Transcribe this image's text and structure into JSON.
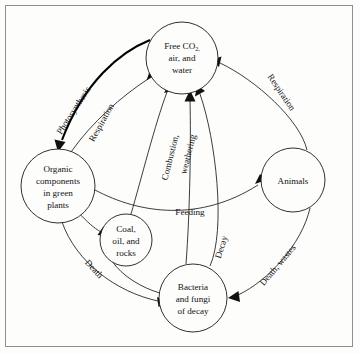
{
  "figure": {
    "background_color": "#fdfdfc",
    "frame_color": "#8f8f8f",
    "ink_color": "#111111"
  },
  "nodes": [
    {
      "id": "free-co2",
      "name": "free-co2-node",
      "lines": [
        "Free CO",
        "air, and",
        "water"
      ],
      "line1_main": "Free CO",
      "line1_sub": "2,",
      "line2": "air, and",
      "line3": "water",
      "cx": 182,
      "cy": 58,
      "r": 36
    },
    {
      "id": "organic-components",
      "name": "organic-components-node",
      "lines": [
        "Organic",
        "components",
        "in green",
        "plants"
      ],
      "cx": 58,
      "cy": 186,
      "r": 37
    },
    {
      "id": "coal-oil-rocks",
      "name": "coal-oil-rocks-node",
      "lines": [
        "Coal,",
        "oil, and",
        "rocks"
      ],
      "cx": 126,
      "cy": 240,
      "r": 26
    },
    {
      "id": "bacteria-fungi",
      "name": "bacteria-fungi-node",
      "lines": [
        "Bacteria",
        "and fungi",
        "of decay"
      ],
      "cx": 193,
      "cy": 298,
      "r": 34
    },
    {
      "id": "animals",
      "name": "animals-node",
      "lines": [
        "Animals"
      ],
      "cx": 293,
      "cy": 180,
      "r": 32
    }
  ],
  "edges": [
    {
      "id": "photosynthesis",
      "name": "photosynthesis-arrow",
      "label": "Photosynthesis",
      "from": "free-co2",
      "to": "organic-components",
      "style": "bold",
      "label_x": 76,
      "label_y": 112,
      "label_rotate": -57
    },
    {
      "id": "respiration-plants",
      "name": "respiration-plants-arrow",
      "label": "Respiration",
      "from": "organic-components",
      "to": "free-co2",
      "style": "thin",
      "label_x": 104,
      "label_y": 124,
      "label_rotate": -61
    },
    {
      "id": "combustion",
      "name": "combustion-arrow",
      "label": "Combustion,",
      "from": "coal-oil-rocks",
      "to": "free-co2",
      "style": "thin",
      "label_x": 173,
      "label_y": 158,
      "label_rotate": -76
    },
    {
      "id": "weathering",
      "name": "weathering-arrow",
      "label": "weathering",
      "from": "coal-oil-rocks",
      "to": "free-co2",
      "style": "thin",
      "label_x": 191,
      "label_y": 155,
      "label_rotate": -76
    },
    {
      "id": "respiration-animals",
      "name": "respiration-animals-arrow",
      "label": "Respiration",
      "from": "animals",
      "to": "free-co2",
      "style": "thin",
      "label_x": 279,
      "label_y": 94,
      "label_rotate": 56
    },
    {
      "id": "feeding",
      "name": "feeding-arrow",
      "label": "Feeding",
      "from": "organic-components",
      "to": "animals",
      "style": "thin",
      "label_x": 190,
      "label_y": 215,
      "label_rotate": 0
    },
    {
      "id": "death-plants",
      "name": "death-plants-arrow",
      "label": "Death",
      "from": "organic-components",
      "to": "bacteria-fungi",
      "style": "thin",
      "label_x": 92,
      "label_y": 271,
      "label_rotate": 47
    },
    {
      "id": "death-wastes",
      "name": "death-wastes-arrow",
      "label": "Death, wastes",
      "from": "animals",
      "to": "bacteria-fungi",
      "style": "thin",
      "label_x": 280,
      "label_y": 267,
      "label_rotate": -50
    },
    {
      "id": "decay",
      "name": "decay-arrow",
      "label": "Decay",
      "from": "bacteria-fungi",
      "to": "free-co2",
      "style": "thin",
      "label_x": 224,
      "label_y": 248,
      "label_rotate": -72
    },
    {
      "id": "plants-to-coal",
      "name": "plants-to-coal-arrow",
      "label": "",
      "from": "organic-components",
      "to": "coal-oil-rocks",
      "style": "thin"
    },
    {
      "id": "coal-to-bacteria",
      "name": "coal-to-bacteria-link",
      "label": "",
      "from": "coal-oil-rocks",
      "to": "bacteria-fungi",
      "style": "thin"
    }
  ]
}
